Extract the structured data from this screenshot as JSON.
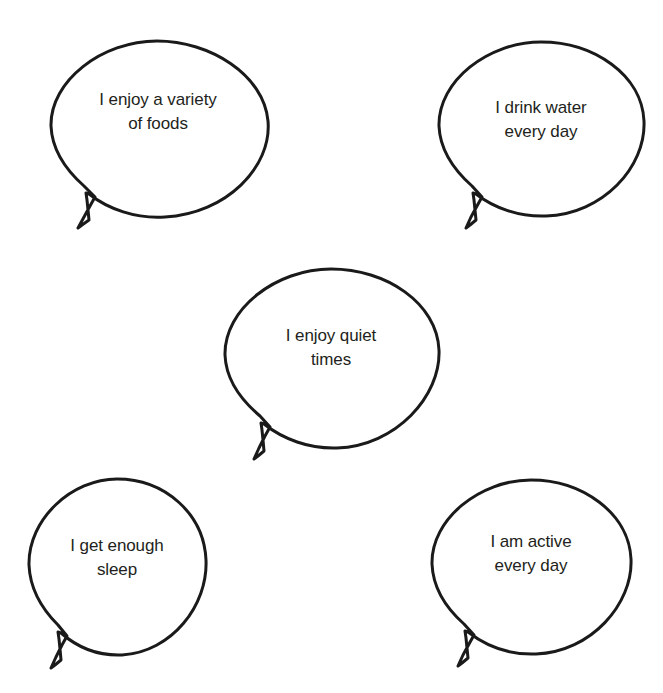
{
  "page": {
    "background_color": "#ffffff",
    "stroke_color": "#1a1a1a",
    "text_color": "#231f20"
  },
  "bubbles": [
    {
      "id": "variety-of-foods",
      "line1": "I enjoy a variety",
      "line2": "of foods",
      "text": "I enjoy a variety\nof foods"
    },
    {
      "id": "drink-water",
      "line1": "I drink water",
      "line2": "every day",
      "text": "I drink water\nevery day"
    },
    {
      "id": "quiet-times",
      "line1": "I enjoy quiet",
      "line2": "times",
      "text": "I enjoy quiet\ntimes"
    },
    {
      "id": "enough-sleep",
      "line1": "I get enough",
      "line2": "sleep",
      "text": "I get enough\nsleep"
    },
    {
      "id": "active-every-day",
      "line1": "I am active",
      "line2": "every day",
      "text": "I am active\nevery day"
    }
  ]
}
